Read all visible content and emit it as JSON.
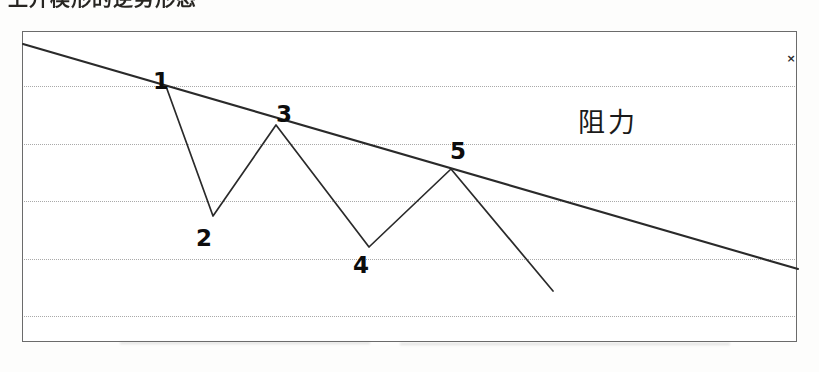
{
  "caption": {
    "text": "上升楔形的逆势形态"
  },
  "chart_data": {
    "type": "line",
    "title": "",
    "xlabel": "",
    "ylabel": "",
    "xlim": [
      0,
      775
    ],
    "ylim": [
      311,
      0
    ],
    "grid": true,
    "grid_orientation": "horizontal",
    "gridline_y": [
      54,
      112,
      169,
      227,
      284
    ],
    "legend": "none",
    "series": [
      {
        "name": "price-zigzag",
        "points": [
          {
            "label": "1",
            "x": 144,
            "y": 57
          },
          {
            "label": "2",
            "x": 190,
            "y": 184
          },
          {
            "label": "3",
            "x": 253,
            "y": 93
          },
          {
            "label": "4",
            "x": 346,
            "y": 215
          },
          {
            "label": "5",
            "x": 428,
            "y": 137
          },
          {
            "label": "",
            "x": 530,
            "y": 259
          }
        ]
      },
      {
        "name": "resistance-trendline",
        "points": [
          {
            "label": "",
            "x": 0,
            "y": 12
          },
          {
            "label": "",
            "x": 775,
            "y": 237
          }
        ]
      }
    ],
    "annotations": [
      {
        "name": "resistance-label",
        "text": "阻力",
        "x": 585,
        "y": 88
      },
      {
        "name": "close-marker",
        "text": "×",
        "x": 768,
        "y": 26
      }
    ],
    "point_labels": [
      {
        "text": "1",
        "x": 138,
        "y": 49
      },
      {
        "text": "2",
        "x": 181,
        "y": 206
      },
      {
        "text": "3",
        "x": 261,
        "y": 82
      },
      {
        "text": "4",
        "x": 338,
        "y": 233
      },
      {
        "text": "5",
        "x": 435,
        "y": 119
      }
    ],
    "colors": {
      "line": "#2a2a2a",
      "trendline": "#2a2a2a",
      "grid": "#a9a9a9",
      "border": "#6b6b6b",
      "background": "#ffffff",
      "label": "#0d0d0d"
    }
  }
}
